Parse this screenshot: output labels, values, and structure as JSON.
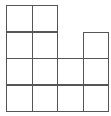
{
  "diagram": {
    "type": "grid-shape",
    "origin": {
      "x": 6,
      "y": 5
    },
    "cell_size": {
      "w": 25.5,
      "h": 26.5
    },
    "line_color": "#555555",
    "background": "#ffffff",
    "columns": 4,
    "max_rows": 4,
    "column_heights": [
      4,
      4,
      2,
      3
    ],
    "total_squares": 13
  }
}
